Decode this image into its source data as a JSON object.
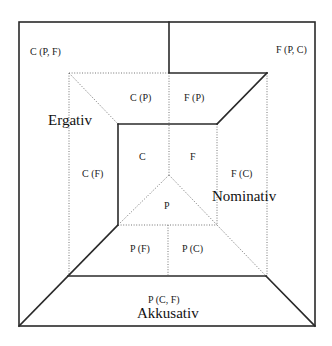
{
  "diagram": {
    "regions": [
      {
        "id": "c-pf",
        "label": "C (P, F)"
      },
      {
        "id": "f-pc",
        "label": "F (P, C)"
      },
      {
        "id": "c-p",
        "label": "C (P)"
      },
      {
        "id": "f-p",
        "label": "F (P)"
      },
      {
        "id": "c",
        "label": "C"
      },
      {
        "id": "f",
        "label": "F"
      },
      {
        "id": "c-f",
        "label": "C (F)"
      },
      {
        "id": "f-c",
        "label": "F (C)"
      },
      {
        "id": "p",
        "label": "P"
      },
      {
        "id": "p-f",
        "label": "P (F)"
      },
      {
        "id": "p-c",
        "label": "P (C)"
      },
      {
        "id": "p-cf",
        "label": "P (C, F)"
      }
    ],
    "cases": {
      "ergativ": "Ergativ",
      "nominativ": "Nominativ",
      "akkusativ": "Akkusativ"
    },
    "colors": {
      "line": "#2a2a2a",
      "dotted": "#666666",
      "text": "#222222",
      "background": "#ffffff"
    }
  }
}
